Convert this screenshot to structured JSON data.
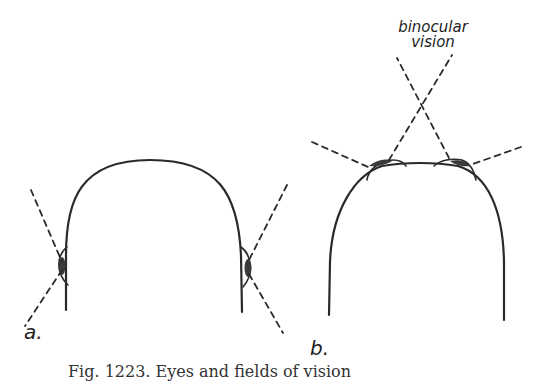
{
  "figure": {
    "panels": [
      {
        "id": "a",
        "label": "a.",
        "description": "head with eyes on sides (lateral vision)"
      },
      {
        "id": "b",
        "label": "b.",
        "description": "head with eyes in front (binocular vision)"
      }
    ],
    "annotation": {
      "line1": "binocular",
      "line2": "vision"
    },
    "caption": "Fig. 1223. Eyes and fields of vision"
  },
  "colors": {
    "stroke": "#2a2a2a",
    "eye_fill": "#3a3a3a",
    "background": "#ffffff"
  }
}
